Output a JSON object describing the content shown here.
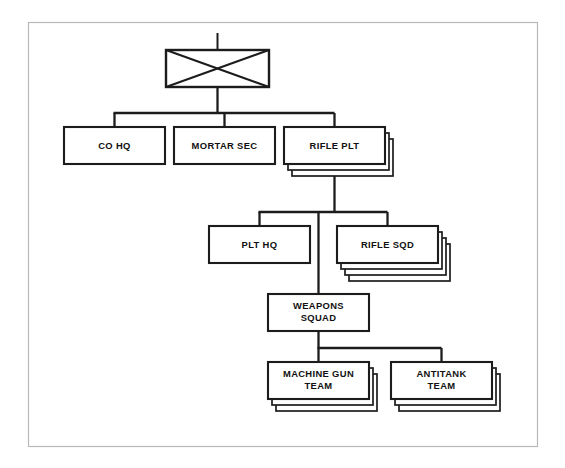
{
  "diagram": {
    "frame": {
      "color": "#b9b9b9",
      "x": 28,
      "y": 22,
      "width": 510,
      "height": 425
    },
    "line_color": "#1c1c1c",
    "box_fill": "#ffffff",
    "background": "#ffffff",
    "root_symbol": {
      "name": "company-symbol",
      "label": "",
      "shape": "rectangle-with-x-diagonals",
      "x": 166,
      "y": 50,
      "width": 103,
      "height": 37
    },
    "tier1": [
      {
        "id": "co-hq",
        "label": "CO HQ",
        "x": 64,
        "y": 127,
        "width": 101,
        "height": 37,
        "shadows": 0
      },
      {
        "id": "mortar-sec",
        "label": "MORTAR SEC",
        "x": 174,
        "y": 127,
        "width": 101,
        "height": 37,
        "shadows": 0
      },
      {
        "id": "rifle-plt",
        "label": "RIFLE PLT",
        "x": 284,
        "y": 127,
        "width": 101,
        "height": 37,
        "shadows": 2
      }
    ],
    "tier2": [
      {
        "id": "plt-hq",
        "label": "PLT HQ",
        "x": 209,
        "y": 226,
        "width": 101,
        "height": 37,
        "shadows": 0
      },
      {
        "id": "rifle-sqd",
        "label": "RIFLE SQD",
        "x": 337,
        "y": 226,
        "width": 101,
        "height": 37,
        "shadows": 3
      }
    ],
    "tier3": [
      {
        "id": "weapons-squad",
        "label": "WEAPONS\nSQUAD",
        "line1": "WEAPONS",
        "line2": "SQUAD",
        "x": 268,
        "y": 294,
        "width": 101,
        "height": 37,
        "shadows": 0
      }
    ],
    "tier4": [
      {
        "id": "machine-gun-team",
        "label": "MACHINE GUN\nTEAM",
        "line1": "MACHINE GUN",
        "line2": "TEAM",
        "x": 268,
        "y": 362,
        "width": 101,
        "height": 37,
        "shadows": 2
      },
      {
        "id": "antitank-team",
        "label": "ANTITANK\nTEAM",
        "line1": "ANTITANK",
        "line2": "TEAM",
        "x": 391,
        "y": 362,
        "width": 101,
        "height": 37,
        "shadows": 2
      }
    ]
  }
}
